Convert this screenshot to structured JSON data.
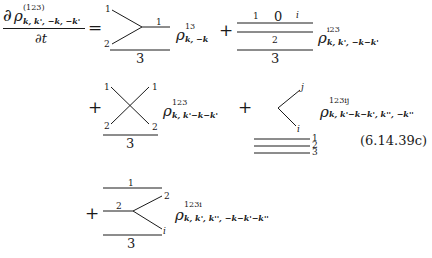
{
  "equation": {
    "number": "(6.14.39c)",
    "lhs": {
      "numerator_d": "∂",
      "numerator_rho": "ρ",
      "numerator_sup": "(123)",
      "numerator_sub": "k, k', −k, −k'",
      "denominator": "∂t",
      "equals": "="
    },
    "terms": [
      {
        "id": "term1",
        "prefix": "",
        "diagram": "vertex-merge",
        "labels": {
          "top_left": "1",
          "bottom_left": "2",
          "right": "1",
          "bottom": "3"
        },
        "rho_sup": "13",
        "rho_sub": "k, −k"
      },
      {
        "id": "term2",
        "prefix": "+",
        "diagram": "three-lines-loop",
        "labels": {
          "line1_left": "1",
          "loop": "0",
          "line1_right": "i",
          "line2": "2",
          "line3": "3"
        },
        "rho_sup": "i23",
        "rho_sub": "k, k', −k−k'"
      },
      {
        "id": "term3",
        "prefix": "+",
        "diagram": "crossing",
        "labels": {
          "top_left": "1",
          "top_right": "1",
          "bottom_left": "2",
          "bottom_right": "2",
          "bottom": "3"
        },
        "rho_sup": "123",
        "rho_sub": "k, k'−k−k'"
      },
      {
        "id": "term4",
        "prefix": "+",
        "diagram": "angle-with-three-lines",
        "labels": {
          "upper": "j",
          "lower": "i",
          "line1": "1",
          "line2": "2",
          "line3": "3"
        },
        "rho_sup": "123ij",
        "rho_sub": "k, k'−k−k', k'', −k''"
      },
      {
        "id": "term5",
        "prefix": "+",
        "diagram": "fork",
        "labels": {
          "top": "1",
          "left": "2",
          "upper_right": "2",
          "lower_right": "i",
          "bottom": "3"
        },
        "rho_sup": "123i",
        "rho_sub": "k, k', k'', −k−k'−k''"
      }
    ]
  }
}
